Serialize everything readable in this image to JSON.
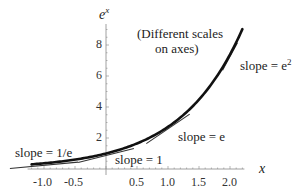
{
  "chart_data": {
    "type": "line",
    "title": "",
    "function": "e^x",
    "xlabel": "x",
    "ylabel": "e^x",
    "annotation": [
      "(Different scales",
      "on axes)"
    ],
    "xlim": [
      -1.2,
      2.2
    ],
    "ylim": [
      0,
      9.03
    ],
    "x_ticks": [
      -1.0,
      -0.5,
      0.5,
      1.0,
      1.5,
      2.0
    ],
    "x_tick_labels": [
      "-1.0",
      "-0.5",
      "0.5",
      "1.0",
      "1.5",
      "2.0"
    ],
    "y_ticks": [
      2,
      4,
      6,
      8
    ],
    "y_tick_labels": [
      "2",
      "4",
      "6",
      "8"
    ],
    "grid": false,
    "series": [
      {
        "name": "e^x",
        "x": [
          -1.2,
          -1.0,
          -0.5,
          0.0,
          0.5,
          1.0,
          1.5,
          2.0,
          2.2
        ],
        "values": [
          0.301,
          0.368,
          0.607,
          1.0,
          1.649,
          2.718,
          4.482,
          7.389,
          9.025
        ]
      }
    ],
    "tangents": [
      {
        "x": -1,
        "y": 0.368,
        "slope": 0.368,
        "label": "slope = 1/e"
      },
      {
        "x": 0,
        "y": 1.0,
        "slope": 1.0,
        "label": "slope = 1"
      },
      {
        "x": 1,
        "y": 2.718,
        "slope": 2.718,
        "label": "slope = e"
      },
      {
        "x": 2,
        "y": 7.389,
        "slope": 7.389,
        "label": "slope = e²"
      }
    ]
  },
  "labels": {
    "y_axis": "e",
    "y_axis_sup": "x",
    "x_axis": "x",
    "annotation_line1": "(Different scales",
    "annotation_line2": "on axes)",
    "slope_inv_e": "slope = 1/e",
    "slope_one": "slope = 1",
    "slope_e": "slope = e",
    "slope_e2_base": "slope = e",
    "slope_e2_sup": "2"
  },
  "ticks": {
    "x": [
      "-1.0",
      "-0.5",
      "0.5",
      "1.0",
      "1.5",
      "2.0"
    ],
    "y": [
      "2",
      "4",
      "6",
      "8"
    ]
  }
}
